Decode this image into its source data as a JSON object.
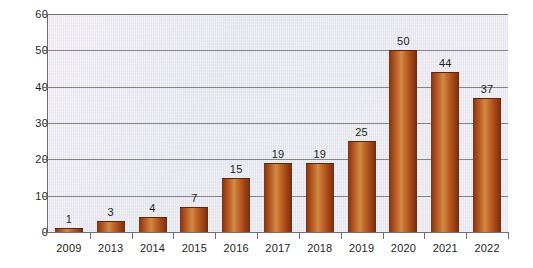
{
  "chart_data": {
    "type": "bar",
    "title": "",
    "subtitle": "",
    "xlabel": "",
    "ylabel": "",
    "categories": [
      "2009",
      "2013",
      "2014",
      "2015",
      "2016",
      "2017",
      "2018",
      "2019",
      "2020",
      "2021",
      "2022"
    ],
    "values": [
      1,
      3,
      4,
      7,
      15,
      19,
      19,
      25,
      50,
      44,
      37
    ],
    "data_labels": [
      "1",
      "3",
      "4",
      "7",
      "15",
      "19",
      "19",
      "25",
      "50",
      "44",
      "37"
    ],
    "ylim": [
      0,
      60
    ],
    "y_ticks": [
      0,
      10,
      20,
      30,
      40,
      50,
      60
    ],
    "y_tick_labels": [
      "0",
      "10",
      "20",
      "30",
      "40",
      "50",
      "60"
    ],
    "grid": true,
    "grid_axis": "y",
    "legend": false,
    "legend_position": "none",
    "bar_color": "#b85a20",
    "bar_edge_color": "#5d2409",
    "plot_background": "#e7e8ef",
    "gridline_color": "#82828c",
    "text_color": "#231f20"
  }
}
